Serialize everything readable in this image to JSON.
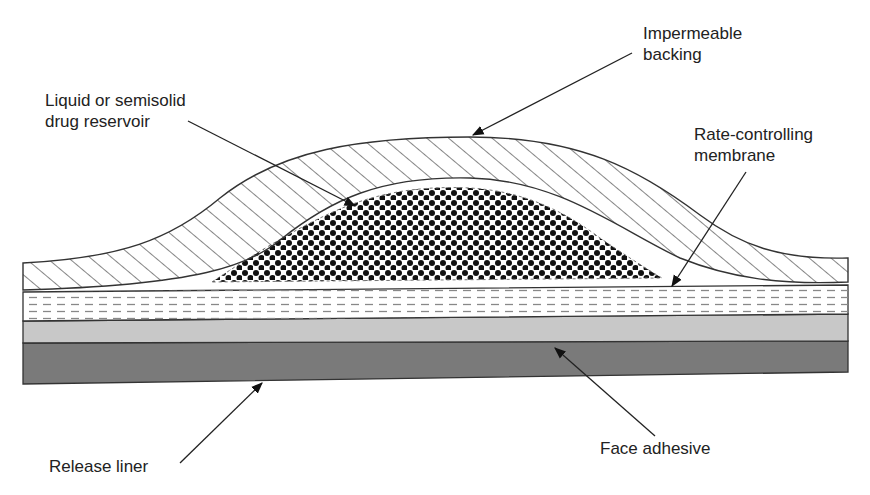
{
  "figure": {
    "type": "cross-section diagram"
  },
  "labels": {
    "impermeable_backing": "Impermeable\nbacking",
    "drug_reservoir": "Liquid or semisolid\ndrug reservoir",
    "rate_membrane": "Rate-controlling\nmembrane",
    "face_adhesive": "Face adhesive",
    "release_liner": "Release liner"
  },
  "layers": [
    {
      "name": "Impermeable backing",
      "pattern": "diagonal hatch"
    },
    {
      "name": "Liquid or semisolid drug reservoir",
      "pattern": "dots"
    },
    {
      "name": "Rate-controlling membrane",
      "pattern": "dashed lines"
    },
    {
      "name": "Face adhesive",
      "fill": "#c8c8c8"
    },
    {
      "name": "Release liner",
      "fill": "#7a7a7a"
    }
  ],
  "colors": {
    "line": "#333333",
    "adhesive": "#c8c8c8",
    "liner": "#7a7a7a",
    "membrane_dash": "#888888"
  }
}
